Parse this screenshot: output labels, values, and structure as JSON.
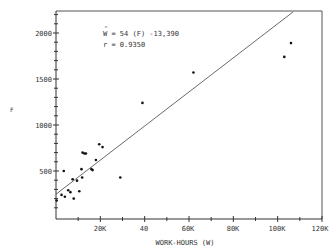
{
  "chart_data": {
    "type": "scatter",
    "title": "",
    "xlabel": "WORK-HOURS (W)",
    "ylabel": "F",
    "xlim": [
      0,
      120000
    ],
    "ylim": [
      0,
      2250
    ],
    "x_ticks": [
      0,
      20000,
      40000,
      60000,
      80000,
      100000,
      120000
    ],
    "x_tick_labels": [
      "",
      "20K",
      "40",
      "60K",
      "80K",
      "100K",
      "120K"
    ],
    "y_ticks": [
      500,
      1000,
      1500,
      2000
    ],
    "y_tick_labels": [
      "500",
      "1000",
      "1500",
      "2000"
    ],
    "grid": false,
    "annotations": [
      "Ŵ = 54 (F) -13,390",
      "r = 0.9350"
    ],
    "regression_line": {
      "slope_w_per_f": 54,
      "intercept": -13390,
      "from": [
        0,
        248
      ],
      "to": [
        107000,
        2230
      ]
    },
    "points": [
      {
        "x": 300,
        "y": 180
      },
      {
        "x": 2500,
        "y": 240
      },
      {
        "x": 3500,
        "y": 500
      },
      {
        "x": 4000,
        "y": 220
      },
      {
        "x": 5500,
        "y": 290
      },
      {
        "x": 6500,
        "y": 270
      },
      {
        "x": 7500,
        "y": 410
      },
      {
        "x": 8000,
        "y": 200
      },
      {
        "x": 9500,
        "y": 395
      },
      {
        "x": 10500,
        "y": 280
      },
      {
        "x": 11500,
        "y": 520
      },
      {
        "x": 11800,
        "y": 430
      },
      {
        "x": 12000,
        "y": 700
      },
      {
        "x": 12800,
        "y": 690
      },
      {
        "x": 13500,
        "y": 690
      },
      {
        "x": 16000,
        "y": 520
      },
      {
        "x": 16500,
        "y": 510
      },
      {
        "x": 18000,
        "y": 620
      },
      {
        "x": 19500,
        "y": 790
      },
      {
        "x": 21000,
        "y": 760
      },
      {
        "x": 29000,
        "y": 430
      },
      {
        "x": 39000,
        "y": 1240
      },
      {
        "x": 62000,
        "y": 1570
      },
      {
        "x": 103000,
        "y": 1740
      },
      {
        "x": 106000,
        "y": 1890
      }
    ]
  },
  "labels": {
    "y_axis": "F",
    "x_axis": "WORK-HOURS (W)",
    "equation_hat": "^",
    "equation": "W = 54 (F) -13,390",
    "r_value": "r = 0.9350",
    "y500": "500",
    "y1000": "1000",
    "y1500": "1500",
    "y2000": "2000",
    "x20": "20K",
    "x40": "40",
    "x60": "60K",
    "x80": "80K",
    "x100": "100K",
    "x120": "120K"
  }
}
